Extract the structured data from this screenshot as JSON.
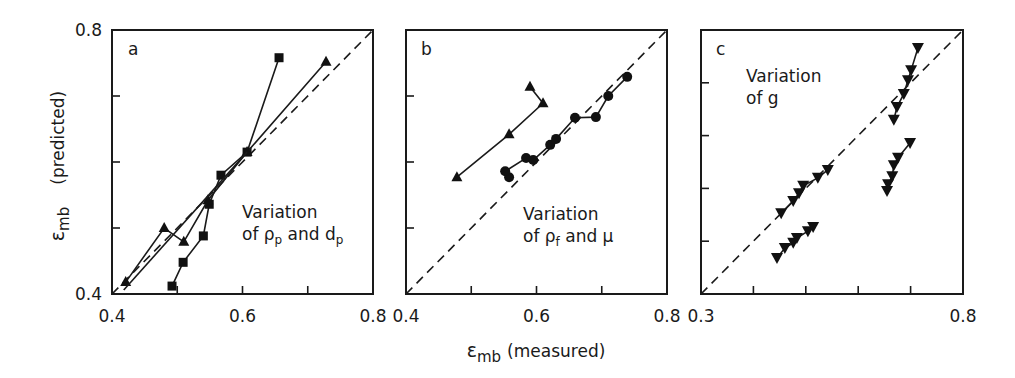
{
  "figure": {
    "shared_xlabel": "ε_mb (measured)",
    "shared_xlabel_main": "ε",
    "shared_xlabel_sub": "mb",
    "shared_xlabel_rest": "(measured)",
    "shared_ylabel_main": "ε",
    "shared_ylabel_sub": "mb",
    "shared_ylabel_rest": "(predicted)"
  },
  "chart_data": [
    {
      "type": "scatter",
      "panel": "a",
      "annotation": [
        "Variation",
        "of ρp and dp"
      ],
      "annotation_line2_parts": [
        "of ρ",
        "p",
        " and d",
        "p"
      ],
      "xlabel": "ε_mb (measured)",
      "ylabel": "ε_mb (predicted)",
      "xlim": [
        0.4,
        0.8
      ],
      "ylim": [
        0.4,
        0.8
      ],
      "xticks": [
        0.4,
        0.5,
        0.6,
        0.7,
        0.8
      ],
      "xtick_labels": [
        "0.4",
        "",
        "0.6",
        "",
        "0.8"
      ],
      "yticks": [
        0.4,
        0.5,
        0.6,
        0.7,
        0.8
      ],
      "ytick_labels": [
        "0.4",
        "",
        "",
        "",
        "0.8"
      ],
      "reference_line": "y = x (dashed)",
      "grid": false,
      "series": [
        {
          "name": "squares",
          "marker": "square",
          "points": [
            [
              0.492,
              0.412
            ],
            [
              0.509,
              0.448
            ],
            [
              0.54,
              0.488
            ],
            [
              0.549,
              0.536
            ],
            [
              0.567,
              0.58
            ],
            [
              0.607,
              0.615
            ],
            [
              0.656,
              0.758
            ]
          ]
        },
        {
          "name": "triangles",
          "marker": "triangle-up",
          "points": [
            [
              0.421,
              0.418
            ],
            [
              0.48,
              0.5
            ],
            [
              0.51,
              0.479
            ],
            [
              0.547,
              0.542
            ],
            [
              0.607,
              0.615
            ],
            [
              0.728,
              0.752
            ]
          ]
        },
        {
          "name": "line",
          "marker": "none",
          "points": [
            [
              0.418,
              0.406
            ],
            [
              0.607,
              0.615
            ]
          ]
        }
      ]
    },
    {
      "type": "scatter",
      "panel": "b",
      "annotation": [
        "Variation",
        "of ρf and μ"
      ],
      "annotation_line2_parts": [
        "of ρ",
        "f",
        " and μ",
        ""
      ],
      "xlabel": "ε_mb (measured)",
      "ylabel": "ε_mb (predicted)",
      "xlim": [
        0.4,
        0.8
      ],
      "ylim": [
        0.4,
        0.8
      ],
      "xticks": [
        0.4,
        0.5,
        0.6,
        0.7,
        0.8
      ],
      "xtick_labels": [
        "0.4",
        "",
        "0.6",
        "",
        "0.8"
      ],
      "yticks": [
        0.4,
        0.5,
        0.6,
        0.7,
        0.8
      ],
      "ytick_labels": [
        "",
        "",
        "",
        "",
        ""
      ],
      "reference_line": "y = x (dashed)",
      "grid": false,
      "series": [
        {
          "name": "triangles",
          "marker": "triangle-up",
          "points": [
            [
              0.59,
              0.714
            ],
            [
              0.61,
              0.689
            ],
            [
              0.558,
              0.642
            ],
            [
              0.478,
              0.577
            ]
          ]
        },
        {
          "name": "circles",
          "marker": "circle",
          "points": [
            [
              0.558,
              0.577
            ],
            [
              0.552,
              0.586
            ],
            [
              0.584,
              0.606
            ],
            [
              0.595,
              0.603
            ],
            [
              0.621,
              0.626
            ],
            [
              0.63,
              0.635
            ],
            [
              0.659,
              0.667
            ],
            [
              0.691,
              0.668
            ],
            [
              0.71,
              0.7
            ],
            [
              0.739,
              0.729
            ]
          ]
        }
      ]
    },
    {
      "type": "scatter",
      "panel": "c",
      "annotation": [
        "Variation",
        "of g"
      ],
      "annotation_line2_parts": [
        "of g",
        "",
        "",
        ""
      ],
      "xlabel": "ε_mb (measured)",
      "ylabel": "ε_mb (predicted)",
      "xlim": [
        0.3,
        0.8
      ],
      "ylim": [
        0.3,
        0.8
      ],
      "xticks": [
        0.3,
        0.4,
        0.5,
        0.6,
        0.7,
        0.8
      ],
      "xtick_labels": [
        "0.3",
        "",
        "",
        "",
        "",
        "0.8"
      ],
      "yticks": [
        0.3,
        0.4,
        0.5,
        0.6,
        0.7,
        0.8
      ],
      "ytick_labels": [
        "",
        "",
        "",
        "",
        "",
        ""
      ],
      "reference_line": "y = x (dashed)",
      "grid": false,
      "series": [
        {
          "name": "group-1",
          "marker": "triangle-down",
          "points": [
            [
              0.445,
              0.368
            ],
            [
              0.46,
              0.387
            ],
            [
              0.476,
              0.397
            ],
            [
              0.483,
              0.406
            ],
            [
              0.504,
              0.419
            ],
            [
              0.514,
              0.427
            ]
          ]
        },
        {
          "name": "group-2",
          "marker": "triangle-down",
          "points": [
            [
              0.453,
              0.453
            ],
            [
              0.476,
              0.476
            ],
            [
              0.487,
              0.491
            ],
            [
              0.495,
              0.505
            ],
            [
              0.523,
              0.52
            ],
            [
              0.542,
              0.535
            ]
          ]
        },
        {
          "name": "group-3",
          "marker": "triangle-down",
          "points": [
            [
              0.655,
              0.495
            ],
            [
              0.657,
              0.508
            ],
            [
              0.665,
              0.523
            ],
            [
              0.668,
              0.544
            ],
            [
              0.676,
              0.558
            ],
            [
              0.699,
              0.586
            ]
          ]
        },
        {
          "name": "group-4",
          "marker": "triangle-down",
          "points": [
            [
              0.668,
              0.63
            ],
            [
              0.674,
              0.654
            ],
            [
              0.687,
              0.679
            ],
            [
              0.695,
              0.705
            ],
            [
              0.701,
              0.724
            ],
            [
              0.714,
              0.766
            ]
          ]
        }
      ]
    }
  ]
}
